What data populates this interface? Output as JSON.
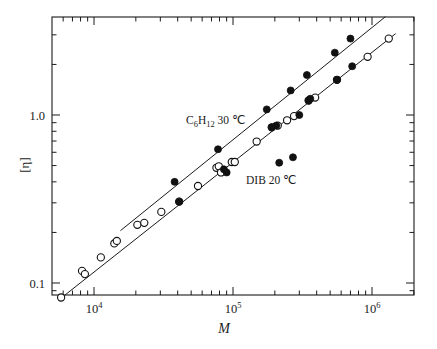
{
  "figure": {
    "background": "#ffffff",
    "ink_color": "#1a1a1a"
  },
  "axes": {
    "x": {
      "title": "M",
      "scale": "log",
      "range": [
        5600,
        2000000
      ],
      "tick_labels": [
        "10",
        "10",
        "10"
      ],
      "tick_exponents": [
        "4",
        "5",
        "6"
      ],
      "tick_values": [
        10000,
        100000,
        1000000
      ],
      "ticks_on": [
        "bottom",
        "top"
      ],
      "tick_direction": "in"
    },
    "y": {
      "title": "[η]",
      "scale": "log",
      "range": [
        0.075,
        4.2
      ],
      "tick_labels": [
        "1.0",
        "0.1"
      ],
      "tick_values": [
        1.0,
        0.1
      ],
      "ticks_on": [
        "left",
        "right"
      ],
      "tick_direction": "in"
    }
  },
  "annotations": [
    {
      "name": "series-label-c6h12",
      "text_main": "C",
      "text_sub": "6",
      "text_main2": "H",
      "text_sub2": "12",
      "text_tail": " 30 ℃",
      "full": "C6H12 30 ℃",
      "x": 186,
      "y": 124
    },
    {
      "name": "series-label-dib",
      "full": "DIB 20 ℃",
      "x": 246,
      "y": 184
    }
  ],
  "chart_data": {
    "type": "scatter",
    "title": "",
    "xlabel": "M",
    "ylabel": "[η]",
    "xscale": "log",
    "yscale": "log",
    "xlim": [
      5600,
      2000000
    ],
    "ylim": [
      0.075,
      4.2
    ],
    "grid": false,
    "legend_position": "inline-annotation",
    "series": [
      {
        "name": "C6H12 30 ℃",
        "marker": "filled-circle",
        "color": "#111111",
        "points": [
          [
            38000,
            0.4
          ],
          [
            41000,
            0.305
          ],
          [
            78000,
            0.625
          ],
          [
            86000,
            0.475
          ],
          [
            90000,
            0.455
          ],
          [
            175000,
            1.08
          ],
          [
            190000,
            0.845
          ],
          [
            205000,
            0.865
          ],
          [
            215000,
            0.52
          ],
          [
            260000,
            1.4
          ],
          [
            270000,
            0.56
          ],
          [
            300000,
            1.0
          ],
          [
            340000,
            1.73
          ],
          [
            350000,
            1.22
          ],
          [
            360000,
            1.25
          ],
          [
            540000,
            2.35
          ],
          [
            560000,
            1.62
          ],
          [
            700000,
            2.85
          ],
          [
            720000,
            1.95
          ]
        ],
        "fit_line": {
          "x_start": 15500,
          "y_start": 0.205,
          "x_end": 1250000,
          "y_end": 3.85
        }
      },
      {
        "name": "DIB 20 ℃",
        "marker": "open-circle",
        "color": "#111111",
        "points": [
          [
            5800,
            0.082
          ],
          [
            8200,
            0.118
          ],
          [
            8600,
            0.113
          ],
          [
            11200,
            0.142
          ],
          [
            14000,
            0.172
          ],
          [
            14600,
            0.178
          ],
          [
            20500,
            0.222
          ],
          [
            23000,
            0.228
          ],
          [
            30500,
            0.265
          ],
          [
            41000,
            0.305
          ],
          [
            56000,
            0.378
          ],
          [
            76000,
            0.485
          ],
          [
            79000,
            0.495
          ],
          [
            82000,
            0.455
          ],
          [
            98000,
            0.525
          ],
          [
            103000,
            0.525
          ],
          [
            148000,
            0.695
          ],
          [
            190000,
            0.845
          ],
          [
            210000,
            0.865
          ],
          [
            245000,
            0.93
          ],
          [
            275000,
            0.985
          ],
          [
            350000,
            1.22
          ],
          [
            390000,
            1.27
          ],
          [
            560000,
            1.62
          ],
          [
            930000,
            2.22
          ],
          [
            1320000,
            2.85
          ]
        ],
        "fit_line": {
          "x_start": 5550,
          "y_start": 0.079,
          "x_end": 1480000,
          "y_end": 3.05
        }
      }
    ]
  }
}
